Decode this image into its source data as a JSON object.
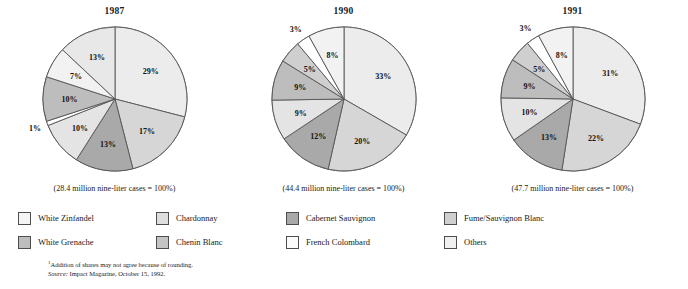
{
  "chart_data": [
    {
      "type": "pie",
      "title": "1987",
      "caption": "(28.4 million nine-liter cases = 100%)",
      "total_label": "28.4 million nine-liter cases",
      "categories": [
        "White Zinfandel",
        "Chardonnay",
        "Cabernet Sauvignon",
        "French Colombard",
        "Chenin Blanc",
        "Fume/Sauvignon Blanc",
        "White Grenache",
        "Others"
      ],
      "values": [
        29,
        17,
        13,
        10,
        1,
        10,
        7,
        13
      ],
      "labels": [
        "29%",
        "17%",
        "13%",
        "10%",
        "1%",
        "10%",
        "7%",
        "13%"
      ],
      "colors": [
        "#ececec",
        "#d6d6d6",
        "#a9a9a9",
        "#e4e4e4",
        "#ffffff",
        "#bdbdbd",
        "#f2f2f2",
        "#e8e8e8"
      ],
      "start_angle": 0,
      "legend_position": "bottom"
    },
    {
      "type": "pie",
      "title": "1990",
      "caption": "(44.4 million nine-liter cases = 100%)",
      "total_label": "44.4 million nine-liter cases",
      "categories": [
        "White Zinfandel",
        "Chardonnay",
        "Cabernet Sauvignon",
        "French Colombard",
        "Chenin Blanc",
        "Fume/Sauvignon Blanc",
        "White Grenache",
        "Others"
      ],
      "values": [
        33,
        20,
        12,
        9,
        9,
        5,
        3,
        8
      ],
      "labels": [
        "33%",
        "20%",
        "12%",
        "9%",
        "9%",
        "5%",
        "3%",
        "8%"
      ],
      "colors": [
        "#ececec",
        "#d6d6d6",
        "#a9a9a9",
        "#e4e4e4",
        "#bdbdbd",
        "#cfcfcf",
        "#ffffff",
        "#f2f2f2"
      ],
      "start_angle": 0,
      "legend_position": "bottom"
    },
    {
      "type": "pie",
      "title": "1991",
      "caption": "(47.7 million nine-liter cases = 100%)",
      "total_label": "47.7 million nine-liter cases",
      "categories": [
        "White Zinfandel",
        "Chardonnay",
        "Cabernet Sauvignon",
        "French Colombard",
        "Chenin Blanc",
        "Fume/Sauvignon Blanc",
        "White Grenache",
        "Others"
      ],
      "values": [
        31,
        22,
        13,
        10,
        9,
        5,
        3,
        8
      ],
      "labels": [
        "31%",
        "22%",
        "13%",
        "10%",
        "9%",
        "5%",
        "3%",
        "8%"
      ],
      "colors": [
        "#ececec",
        "#d6d6d6",
        "#a9a9a9",
        "#e4e4e4",
        "#bdbdbd",
        "#cfcfcf",
        "#ffffff",
        "#f2f2f2"
      ],
      "start_angle": 0,
      "legend_position": "bottom"
    }
  ],
  "legend": {
    "items": [
      {
        "label": "White Zinfandel",
        "color": "#f4f4f4",
        "row": 0,
        "col": 0
      },
      {
        "label": "Chardonnay",
        "color": "#dedede",
        "row": 0,
        "col": 1
      },
      {
        "label": "Cabernet Sauvignon",
        "color": "#a9a9a9",
        "row": 0,
        "col": 2
      },
      {
        "label": "Fume/Sauvignon Blanc",
        "color": "#cfcfcf",
        "row": 0,
        "col": 3
      },
      {
        "label": "White Grenache",
        "color": "#bdbdbd",
        "row": 1,
        "col": 0
      },
      {
        "label": "Chenin Blanc",
        "color": "#c4c4c4",
        "row": 1,
        "col": 1
      },
      {
        "label": "French Colombard",
        "color": "#fbfbfb",
        "row": 1,
        "col": 2
      },
      {
        "label": "Others",
        "color": "#f0f0f0",
        "row": 1,
        "col": 3
      }
    ]
  },
  "footnotes": {
    "rounding_marker": "1",
    "rounding_note": "Addition of shares may not agree because of rounding.",
    "source_word": "Source:",
    "source_text": "Impact Magazine, October 15, 1992."
  }
}
